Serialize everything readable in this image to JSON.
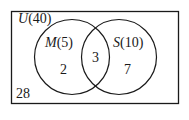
{
  "diagram": {
    "type": "venn",
    "universe": {
      "symbol": "U",
      "count": "(40)",
      "outside": "28"
    },
    "sets": [
      {
        "symbol": "M",
        "count": "(5)",
        "only": "2"
      },
      {
        "symbol": "S",
        "count": "(10)",
        "only": "7"
      }
    ],
    "intersection": "3",
    "colors": {
      "stroke": "#1a1a1a",
      "background": "#ffffff"
    }
  }
}
